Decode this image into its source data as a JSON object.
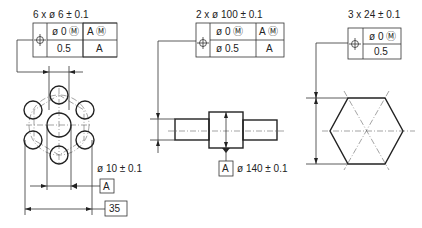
{
  "drawing_1": {
    "title": "6 x ø 6 ± 0.1",
    "frame": {
      "symbol": "position-symbol",
      "row1_col2": "ø 0 Ⓜ",
      "row1_col3": "A Ⓜ",
      "row2_col2": "0.5",
      "row2_col3": "A"
    },
    "diameter_label": "ø 10 ± 0.1",
    "datum_label": "A",
    "basic_dimension": "35"
  },
  "drawing_2": {
    "title": "2 x ø 100 ± 0.1",
    "frame": {
      "symbol": "position-symbol",
      "row1_col2": "ø 0 Ⓜ",
      "row1_col3": "A Ⓜ",
      "row2_col2": "ø 0.5",
      "row2_col3": "A"
    },
    "datum_label": "A",
    "diameter_label": "ø 140 ± 0.1"
  },
  "drawing_3": {
    "title": "3 x 24 ± 0.1",
    "frame": {
      "symbol": "position-symbol",
      "row1_col2": "ø 0 Ⓜ",
      "row2_col2": "0.5"
    }
  }
}
